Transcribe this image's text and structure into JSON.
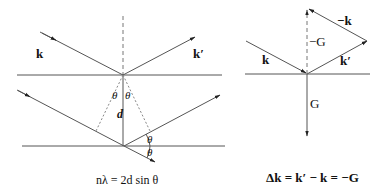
{
  "left_diagram": {
    "label_k": "k",
    "label_kprime": "k′",
    "label_theta_1": "θ",
    "label_theta_2": "θ",
    "label_d": "d",
    "label_theta_3": "θ",
    "label_theta_4": "θ",
    "caption": "nλ = 2d sin θ"
  },
  "right_diagram": {
    "label_k": "k",
    "label_kprime": "k′",
    "label_neg_k": "−k",
    "label_neg_G": "−G",
    "label_G": "G",
    "caption": "Δk = k′ − k = −G"
  },
  "colors": {
    "line": "#555555",
    "text": "#111111",
    "background": "#ffffff"
  }
}
